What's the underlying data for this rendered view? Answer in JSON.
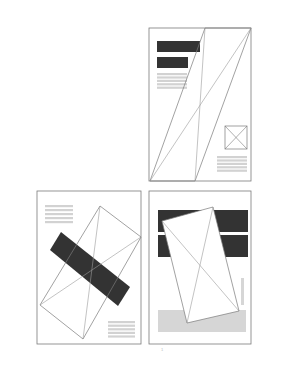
{
  "colors": {
    "frame": "#7a7a7a",
    "dark_block": "#333333",
    "gray_text": "#d2d2d2",
    "line": "#9a9a9a",
    "light_block": "#d6d6d6"
  },
  "pages": [
    {
      "id": "top-right",
      "frame": [
        149,
        28,
        102,
        153
      ],
      "dark_bars": [
        [
          157,
          41,
          43,
          11
        ],
        [
          157,
          57,
          31,
          11
        ]
      ],
      "text_lines": {
        "x": 157,
        "y": 73,
        "w": 30,
        "count": 5,
        "gap": 3.4
      },
      "wire_shape": [
        [
          205,
          28
        ],
        [
          251,
          28
        ],
        [
          195,
          181
        ],
        [
          150,
          181
        ]
      ],
      "wire_lines": [
        [
          [
            150,
            181
          ],
          [
            251,
            28
          ]
        ],
        [
          [
            205,
            28
          ],
          [
            195,
            181
          ]
        ]
      ],
      "image_placeholder": [
        225,
        126,
        22,
        23
      ],
      "text_lines_2": {
        "x": 217,
        "y": 156,
        "w": 30,
        "count": 5,
        "gap": 3.4
      }
    },
    {
      "id": "bottom-left",
      "frame": [
        37,
        191,
        104,
        153
      ],
      "text_lines": {
        "x": 45,
        "y": 205,
        "w": 28,
        "count": 5,
        "gap": 4
      },
      "wire_shape": [
        [
          100,
          206
        ],
        [
          141,
          237
        ],
        [
          83,
          339
        ],
        [
          40,
          305
        ]
      ],
      "wire_lines": [
        [
          [
            100,
            206
          ],
          [
            83,
            339
          ]
        ],
        [
          [
            40,
            305
          ],
          [
            141,
            237
          ]
        ]
      ],
      "dark_rotated": [
        [
          61,
          232
        ],
        [
          130,
          287
        ],
        [
          118,
          306
        ],
        [
          50,
          250
        ]
      ],
      "text_lines_2": {
        "x": 108,
        "y": 321,
        "w": 27,
        "count": 5,
        "gap": 3.6
      }
    },
    {
      "id": "bottom-right",
      "frame": [
        149,
        191,
        102,
        153
      ],
      "dark_bars": [
        [
          158,
          210,
          90,
          22
        ],
        [
          158,
          235,
          90,
          22
        ]
      ],
      "light_block": [
        158,
        310,
        88,
        22
      ],
      "vertical_bar": [
        241,
        278,
        3,
        27
      ],
      "white_quad": [
        [
          162,
          221
        ],
        [
          213,
          207
        ],
        [
          239,
          311
        ],
        [
          187,
          323
        ]
      ],
      "wire_lines": [
        [
          [
            162,
            221
          ],
          [
            239,
            311
          ]
        ],
        [
          [
            213,
            207
          ],
          [
            187,
            323
          ]
        ]
      ]
    }
  ],
  "page_number": "1"
}
